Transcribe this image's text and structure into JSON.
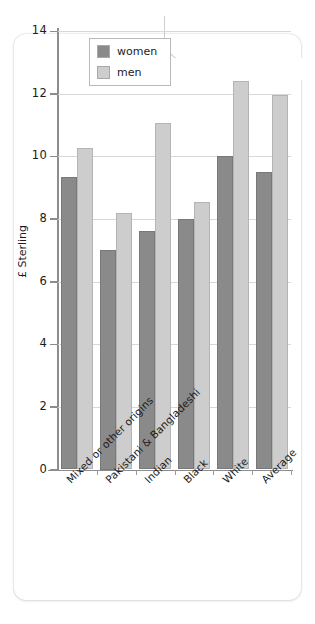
{
  "chart_data": {
    "type": "bar",
    "title": "",
    "xlabel": "",
    "ylabel": "£ Sterling",
    "ylim": [
      0,
      14
    ],
    "yticks": [
      0,
      2,
      4,
      6,
      8,
      10,
      12,
      14
    ],
    "ytick_labels": [
      "0",
      "2",
      "4",
      "6",
      "8",
      "10",
      "12",
      "14"
    ],
    "grid": true,
    "legend_position": "upper left inside",
    "categories": [
      "Mixed or other origins",
      "Pakistani & Bangladeshi",
      "Indian",
      "Black",
      "White",
      "Average"
    ],
    "series": [
      {
        "name": "women",
        "color": "#8a8a8a",
        "values": [
          9.35,
          7.0,
          7.6,
          8.0,
          10.0,
          9.5
        ]
      },
      {
        "name": "men",
        "color": "#cdcdcd",
        "values": [
          10.25,
          8.2,
          11.05,
          8.55,
          12.4,
          11.95
        ]
      }
    ]
  }
}
